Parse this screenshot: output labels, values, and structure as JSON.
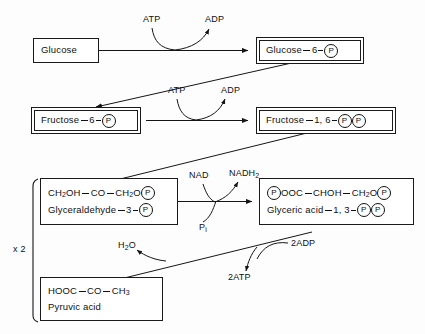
{
  "diagram": {
    "multiplier_label": "x 2",
    "nodes": [
      {
        "id": "glucose",
        "name": "glucose",
        "border": "single",
        "lines": [
          {
            "text": "Glucose",
            "tokens": [
              {
                "t": "text",
                "v": "Glucose"
              }
            ]
          }
        ]
      },
      {
        "id": "glucose-6-phosphate",
        "name": "glucose-6-phosphate",
        "border": "double",
        "lines": [
          {
            "text": "Glucose — 6 — (P)",
            "tokens": [
              {
                "t": "text",
                "v": "Glucose"
              },
              {
                "t": "bond"
              },
              {
                "t": "text",
                "v": "6"
              },
              {
                "t": "bond-short"
              },
              {
                "t": "pcircle",
                "v": "P"
              }
            ]
          }
        ]
      },
      {
        "id": "fructose-6-phosphate",
        "name": "fructose-6-phosphate",
        "border": "double",
        "lines": [
          {
            "text": "Fructose — 6 — (P)",
            "tokens": [
              {
                "t": "text",
                "v": "Fructose"
              },
              {
                "t": "bond"
              },
              {
                "t": "text",
                "v": "6"
              },
              {
                "t": "bond-short"
              },
              {
                "t": "pcircle",
                "v": "P"
              }
            ]
          }
        ]
      },
      {
        "id": "fructose-1-6-bisphosphate",
        "name": "fructose-1,6-bisphosphate",
        "border": "double",
        "lines": [
          {
            "text": "Fructose — 1, 6 — (P)(P)",
            "tokens": [
              {
                "t": "text",
                "v": "Fructose"
              },
              {
                "t": "bond"
              },
              {
                "t": "text",
                "v": "1, 6"
              },
              {
                "t": "bond-short"
              },
              {
                "t": "pcircle",
                "v": "P"
              },
              {
                "t": "pcircle",
                "v": "P"
              }
            ]
          }
        ]
      },
      {
        "id": "glyceraldehyde-3-phosphate",
        "name": "glyceraldehyde-3-phosphate",
        "border": "single-thick",
        "lines": [
          {
            "text": "CH2OH — CO — CH2O (P)",
            "tokens": [
              {
                "t": "text",
                "v": "CH"
              },
              {
                "t": "sub",
                "v": "2"
              },
              {
                "t": "text",
                "v": "OH"
              },
              {
                "t": "bond"
              },
              {
                "t": "text",
                "v": "CO"
              },
              {
                "t": "bond"
              },
              {
                "t": "text",
                "v": "CH"
              },
              {
                "t": "sub",
                "v": "2"
              },
              {
                "t": "text",
                "v": "O"
              },
              {
                "t": "pcircle",
                "v": "P"
              }
            ]
          },
          {
            "text": "Glyceraldehyde — 3 — (P)",
            "tokens": [
              {
                "t": "text",
                "v": "Glyceraldehyde"
              },
              {
                "t": "bond"
              },
              {
                "t": "text",
                "v": "3"
              },
              {
                "t": "bond-short"
              },
              {
                "t": "pcircle",
                "v": "P"
              }
            ]
          }
        ]
      },
      {
        "id": "glyceric-acid-1-3-bisphosphate",
        "name": "glyceric-acid-1,3-bisphosphate",
        "border": "single-thick",
        "lines": [
          {
            "text": "(P)OOC — CHOH — CH2O (P)",
            "tokens": [
              {
                "t": "pcircle",
                "v": "P"
              },
              {
                "t": "text",
                "v": "OOC"
              },
              {
                "t": "bond"
              },
              {
                "t": "text",
                "v": "CHOH"
              },
              {
                "t": "bond"
              },
              {
                "t": "text",
                "v": "CH"
              },
              {
                "t": "sub",
                "v": "2"
              },
              {
                "t": "text",
                "v": "O"
              },
              {
                "t": "pcircle",
                "v": "P"
              }
            ]
          },
          {
            "text": "Glyceric acid — 1, 3 — (P)(P)",
            "tokens": [
              {
                "t": "text",
                "v": "Glyceric acid"
              },
              {
                "t": "bond"
              },
              {
                "t": "text",
                "v": "1, 3"
              },
              {
                "t": "bond-short"
              },
              {
                "t": "pcircle",
                "v": "P"
              },
              {
                "t": "pcircle",
                "v": "P"
              }
            ]
          }
        ]
      },
      {
        "id": "pyruvic-acid",
        "name": "pyruvic-acid",
        "border": "single-thick",
        "lines": [
          {
            "text": "HOOC — CO — CH3",
            "tokens": [
              {
                "t": "text",
                "v": "HOOC"
              },
              {
                "t": "bond"
              },
              {
                "t": "text",
                "v": "CO"
              },
              {
                "t": "bond"
              },
              {
                "t": "text",
                "v": "CH"
              },
              {
                "t": "sub",
                "v": "3"
              }
            ]
          },
          {
            "text": "Pyruvic acid",
            "tokens": [
              {
                "t": "text",
                "v": "Pyruvic acid"
              }
            ]
          }
        ]
      }
    ],
    "cofactors": [
      {
        "id": "atp-1",
        "name": "atp-label-step1",
        "text": "ATP"
      },
      {
        "id": "adp-1",
        "name": "adp-label-step1",
        "text": "ADP"
      },
      {
        "id": "atp-2",
        "name": "atp-label-step3",
        "text": "ATP"
      },
      {
        "id": "adp-2",
        "name": "adp-label-step3",
        "text": "ADP"
      },
      {
        "id": "nad",
        "name": "nad-label",
        "text": "NAD"
      },
      {
        "id": "nadh2",
        "name": "nadh2-label",
        "text": "NADH",
        "sub": "2"
      },
      {
        "id": "pi",
        "name": "inorganic-phosphate-label",
        "text": "P",
        "sub": "i"
      },
      {
        "id": "two-adp",
        "name": "two-adp-label",
        "text": "2ADP"
      },
      {
        "id": "two-atp",
        "name": "two-atp-label",
        "text": "2ATP"
      },
      {
        "id": "water",
        "name": "water-label",
        "text": "H",
        "sub": "2",
        "text2": "O"
      }
    ]
  }
}
